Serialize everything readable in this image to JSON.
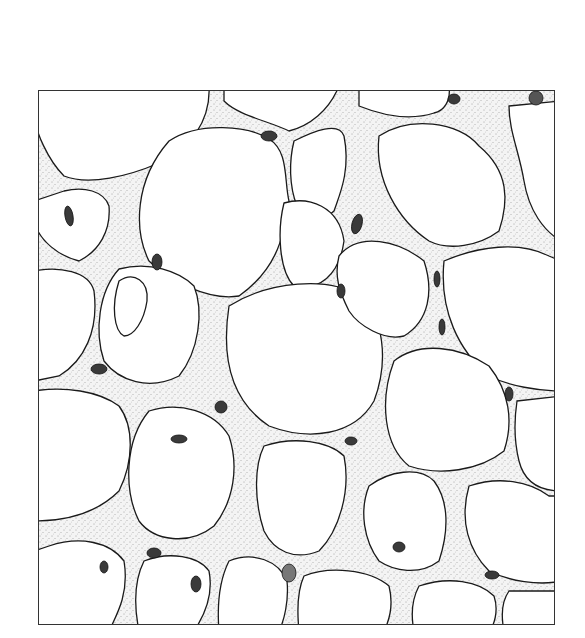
{
  "figure": {
    "frame": {
      "x": 38,
      "y": 90,
      "width": 517,
      "height": 535
    },
    "colors": {
      "line": "#1a1a1a",
      "septum_fill": "#ededed",
      "nucleus": "#2a2a2a",
      "background": "#ffffff"
    }
  }
}
